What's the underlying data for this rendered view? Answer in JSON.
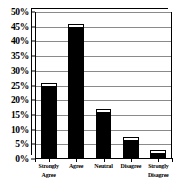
{
  "chart_data": {
    "type": "bar",
    "title": "",
    "subtitle": "",
    "xlabel": "",
    "ylabel": "",
    "categories": [
      "Strongly Agree",
      "Agree",
      "Neutral",
      "Disagree",
      "Strongly Disagree"
    ],
    "category_lines": [
      [
        "Strongly",
        "Agree"
      ],
      [
        "Agree"
      ],
      [
        "Neutral"
      ],
      [
        "Disagree"
      ],
      [
        "Strongly",
        "Disagree"
      ]
    ],
    "values": [
      26,
      46,
      17,
      7.5,
      3
    ],
    "ylim": [
      0,
      50
    ],
    "ytick_step": 5,
    "ytick_labels": [
      "0%",
      "5%",
      "10%",
      "15%",
      "20%",
      "25%",
      "30%",
      "35%",
      "40%",
      "45%",
      "50%"
    ],
    "ytick_values": [
      0,
      5,
      10,
      15,
      20,
      25,
      30,
      35,
      40,
      45,
      50
    ],
    "grid": true,
    "grid_orientation": "horizontal",
    "legend": false,
    "legend_position": "none",
    "style": "3d-column",
    "colors": {
      "bar_fill": "#000000",
      "bar_top_face": "#ffffff",
      "bar_side_face": "#d8d8d8",
      "gridline": "#8a8a8a",
      "axis": "#000000",
      "plot_background": "#ffffff",
      "text": "#000000"
    }
  }
}
